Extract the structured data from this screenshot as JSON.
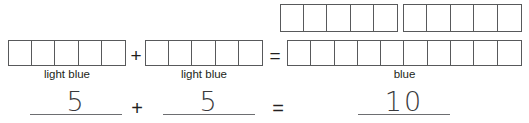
{
  "worksheet": {
    "type": "bar-model-addition",
    "top_row": {
      "bars": [
        {
          "label": "top-addend-bar-1",
          "cells": 5
        },
        {
          "label": "top-addend-bar-2",
          "cells": 5
        }
      ]
    },
    "model_row": {
      "bar1": {
        "cells": 5,
        "caption": "light blue"
      },
      "operator1": "+",
      "bar2": {
        "cells": 5,
        "caption": "light blue"
      },
      "operator2": "=",
      "result_bar": {
        "cells": 10,
        "caption": "blue"
      }
    },
    "equation": {
      "addend1": "5",
      "operator1": "+",
      "addend2": "5",
      "operator2": "=",
      "sum": "10"
    },
    "colors": {
      "outline": "#58595b",
      "text": "#231f20",
      "blank_line": "#6d6e71",
      "handwriting": "#3a3a3c",
      "page": "#ffffff"
    }
  }
}
